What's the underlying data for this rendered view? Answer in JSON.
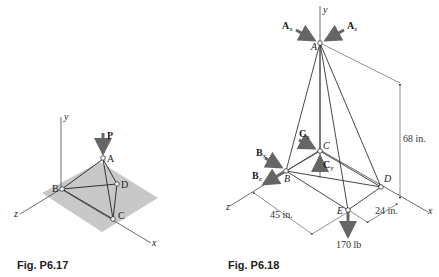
{
  "figures": [
    {
      "caption": "Fig. P6.17",
      "axes": {
        "x": "x",
        "y": "y",
        "z": "z"
      },
      "points": {
        "A": "A",
        "B": "B",
        "C": "C",
        "D": "D"
      },
      "load": {
        "label": "P"
      }
    },
    {
      "caption": "Fig. P6.18",
      "axes": {
        "x": "x",
        "y": "y",
        "z": "z"
      },
      "points": {
        "A": "A",
        "B": "B",
        "C": "C",
        "D": "D",
        "E": "E"
      },
      "forces": {
        "Ax": {
          "main": "A",
          "sub": "x"
        },
        "Az": {
          "main": "A",
          "sub": "z"
        },
        "Bx": {
          "main": "B",
          "sub": "x"
        },
        "Bz": {
          "main": "B",
          "sub": "z"
        },
        "Cx": {
          "main": "C",
          "sub": "x"
        },
        "Cy": {
          "main": "C",
          "sub": "y"
        }
      },
      "dimensions": {
        "height": "68 in.",
        "depth": "45 in.",
        "width": "24 in."
      },
      "load": "170 lb"
    }
  ]
}
